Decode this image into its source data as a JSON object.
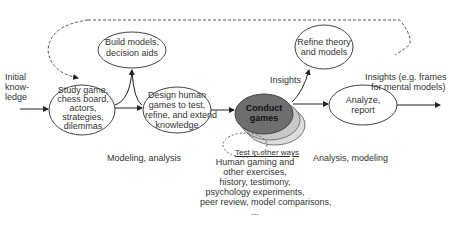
{
  "diagram": {
    "inputs": {
      "initial_knowledge": [
        "Initial",
        "know-",
        "ledge"
      ]
    },
    "nodes": {
      "study": [
        "Study game,",
        "chess board,",
        "actors,",
        "strategies,",
        "dilemmas"
      ],
      "build": [
        "Build models,",
        "decision aids"
      ],
      "design": [
        "Design human",
        "games to test,",
        "refine, and extend",
        "knowledge"
      ],
      "conduct": [
        "Conduct",
        "games"
      ],
      "refine": [
        "Refine theory",
        "and models"
      ],
      "analyze": [
        "Analyze,",
        "report"
      ]
    },
    "labels": {
      "insights": "Insights",
      "insights_output": [
        "Insights (e.g. frames",
        "for mental models)"
      ],
      "modeling_analysis": "Modeling, analysis",
      "analysis_modeling": "Analysis, modeling",
      "test_other_ways": "Test in other ways",
      "other_methods": [
        "Human gaming and",
        "other exercises,",
        "history, testimony,",
        "psychology experiments,",
        "peer review, model comparisons,",
        "..."
      ]
    },
    "colors": {
      "conduct_fill": "#6e6e6e",
      "stack_fill": "#c8c8c8",
      "line": "#333333"
    }
  }
}
